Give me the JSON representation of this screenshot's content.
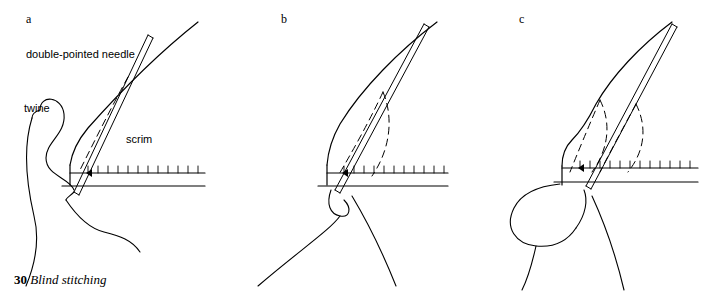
{
  "figure": {
    "caption_number": "30",
    "caption_text": "Blind stitching",
    "panels": [
      {
        "id": "a",
        "label": "a",
        "label_x": 26,
        "label_y": 12,
        "annotations": [
          {
            "name": "needle-label",
            "text": "double-pointed needle",
            "x": 26,
            "y": 48
          },
          {
            "name": "twine-label",
            "text": "twine",
            "x": 24,
            "y": 102
          },
          {
            "name": "scrim-label",
            "text": "scrim",
            "x": 126,
            "y": 133
          }
        ]
      },
      {
        "id": "b",
        "label": "b",
        "label_x": 281,
        "label_y": 12,
        "annotations": []
      },
      {
        "id": "c",
        "label": "c",
        "label_x": 519,
        "label_y": 12,
        "annotations": []
      }
    ],
    "colors": {
      "ink": "#000000",
      "background": "#ffffff"
    }
  }
}
